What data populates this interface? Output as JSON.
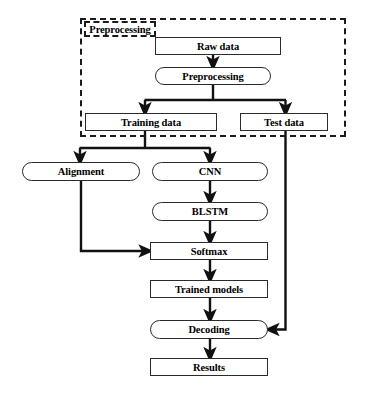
{
  "diagram": {
    "type": "flowchart",
    "canvas": {
      "width": 365,
      "height": 394
    },
    "colors": {
      "background": "#ffffff",
      "node_border": "#2b2b2b",
      "node_fill": "#ffffff",
      "edge": "#111111",
      "group_border": "#1a1a1a",
      "text": "#000000"
    },
    "group": {
      "label": "Preprocessing",
      "style": "dashed",
      "x": 80,
      "y": 18,
      "width": 266,
      "height": 119,
      "label_box": {
        "x": 84,
        "y": 21,
        "width": 72,
        "height": 16
      }
    },
    "nodes": [
      {
        "id": "raw_data",
        "label": "Raw data",
        "shape": "rect",
        "x": 155,
        "y": 37,
        "width": 126,
        "height": 18,
        "font_size": 10.5
      },
      {
        "id": "preprocessing",
        "label": "Preprocessing",
        "shape": "round",
        "x": 155,
        "y": 67,
        "width": 116,
        "height": 18,
        "font_size": 10.5
      },
      {
        "id": "training_data",
        "label": "Training data",
        "shape": "rect",
        "x": 85,
        "y": 113,
        "width": 132,
        "height": 18,
        "font_size": 10.5
      },
      {
        "id": "test_data",
        "label": "Test data",
        "shape": "rect",
        "x": 240,
        "y": 113,
        "width": 88,
        "height": 18,
        "font_size": 10.5
      },
      {
        "id": "alignment",
        "label": "Alignment",
        "shape": "round",
        "x": 22,
        "y": 162,
        "width": 118,
        "height": 19,
        "font_size": 10.5
      },
      {
        "id": "cnn",
        "label": "CNN",
        "shape": "round",
        "x": 152,
        "y": 162,
        "width": 116,
        "height": 19,
        "font_size": 10.5
      },
      {
        "id": "blstm",
        "label": "BLSTM",
        "shape": "round",
        "x": 152,
        "y": 202,
        "width": 116,
        "height": 19,
        "font_size": 10.5
      },
      {
        "id": "softmax",
        "label": "Softmax",
        "shape": "rect",
        "x": 150,
        "y": 242,
        "width": 118,
        "height": 18,
        "font_size": 10.5
      },
      {
        "id": "trained_models",
        "label": "Trained models",
        "shape": "rect",
        "x": 150,
        "y": 280,
        "width": 118,
        "height": 18,
        "font_size": 10.5
      },
      {
        "id": "decoding",
        "label": "Decoding",
        "shape": "round",
        "x": 150,
        "y": 320,
        "width": 118,
        "height": 19,
        "font_size": 10.5
      },
      {
        "id": "results",
        "label": "Results",
        "shape": "rect",
        "x": 150,
        "y": 358,
        "width": 118,
        "height": 18,
        "font_size": 10.5
      }
    ],
    "edges": [
      {
        "from": "raw_data",
        "to": "preprocessing",
        "kind": "straight-down",
        "arrow": true
      },
      {
        "from": "preprocessing",
        "to": "training_data",
        "kind": "split-left",
        "arrow": true
      },
      {
        "from": "preprocessing",
        "to": "test_data",
        "kind": "split-right",
        "arrow": true
      },
      {
        "from": "training_data",
        "to": "alignment",
        "kind": "split-left",
        "arrow": true
      },
      {
        "from": "training_data",
        "to": "cnn",
        "kind": "split-right",
        "arrow": true
      },
      {
        "from": "cnn",
        "to": "blstm",
        "kind": "straight-down",
        "arrow": true
      },
      {
        "from": "blstm",
        "to": "softmax",
        "kind": "straight-down",
        "arrow": true
      },
      {
        "from": "alignment",
        "to": "softmax",
        "kind": "down-then-right",
        "arrow": true
      },
      {
        "from": "softmax",
        "to": "trained_models",
        "kind": "straight-down",
        "arrow": true
      },
      {
        "from": "trained_models",
        "to": "decoding",
        "kind": "straight-down",
        "arrow": true
      },
      {
        "from": "decoding",
        "to": "results",
        "kind": "straight-down",
        "arrow": true
      },
      {
        "from": "test_data",
        "to": "decoding",
        "kind": "down-then-left",
        "arrow": true
      }
    ],
    "caption": ""
  }
}
